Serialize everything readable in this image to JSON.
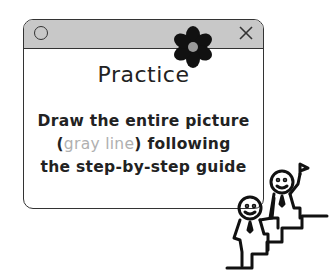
{
  "window": {
    "title": "Practice",
    "line1": "Draw the entire picture",
    "line2_open": "(",
    "line2_gray": "gray line",
    "line2_close": ") following",
    "line3": "the step-by-step guide",
    "titlebar_color": "#c8c8c8",
    "gray_text_color": "#b0b0b0"
  },
  "icons": {
    "left_control": "circle-icon",
    "right_control": "close-icon",
    "decoration": "flower-icon",
    "illustration": "climbing-people-flag-illustration"
  }
}
